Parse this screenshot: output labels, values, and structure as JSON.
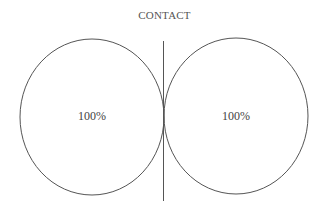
{
  "title": "CONTACT",
  "diagram": {
    "left_circle": {
      "label": "100%",
      "cx": 92,
      "cy": 117,
      "rx": 72,
      "ry": 78
    },
    "right_circle": {
      "label": "100%",
      "cx": 236,
      "cy": 116,
      "rx": 72,
      "ry": 78
    },
    "divider": {
      "x": 163.5,
      "y1": 41,
      "y2": 201
    },
    "stroke_color": "#555555"
  }
}
